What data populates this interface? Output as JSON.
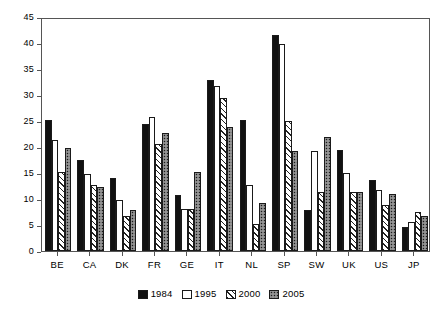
{
  "chart_data": {
    "type": "bar",
    "title": "",
    "subtitle": "",
    "xlabel": "",
    "ylabel": "",
    "ylim": [
      0,
      45
    ],
    "ytick_step": 5,
    "yticks": [
      0,
      5,
      10,
      15,
      20,
      25,
      30,
      35,
      40,
      45
    ],
    "grid": false,
    "legend_position": "bottom-center",
    "categories": [
      "BE",
      "CA",
      "DK",
      "FR",
      "GE",
      "IT",
      "NL",
      "SP",
      "SW",
      "UK",
      "US",
      "JP"
    ],
    "series": [
      {
        "name": "1984",
        "fill": "solid-black",
        "color": "#111111",
        "values": [
          25.2,
          17.5,
          14.0,
          24.5,
          10.7,
          32.8,
          25.1,
          41.5,
          7.9,
          19.5,
          13.7,
          4.7
        ]
      },
      {
        "name": "1995",
        "fill": "white",
        "color": "#ffffff",
        "values": [
          21.4,
          14.8,
          9.9,
          25.7,
          8.1,
          31.7,
          12.7,
          39.9,
          19.2,
          15.0,
          11.7,
          5.6
        ]
      },
      {
        "name": "2000",
        "fill": "diagonal-hatch",
        "color": "#ffffff",
        "values": [
          15.2,
          12.6,
          6.8,
          20.6,
          8.1,
          29.5,
          5.2,
          25.0,
          11.4,
          11.4,
          8.9,
          7.5
        ]
      },
      {
        "name": "2005",
        "fill": "dotted-speckle",
        "color": "#ffffff",
        "values": [
          19.9,
          12.4,
          7.9,
          22.6,
          15.1,
          23.8,
          9.3,
          19.3,
          21.9,
          11.3,
          10.9,
          6.8
        ]
      }
    ]
  },
  "axis": {
    "y_tick_labels": [
      "0",
      "5",
      "10",
      "15",
      "20",
      "25",
      "30",
      "35",
      "40",
      "45"
    ]
  },
  "legend": {
    "items": [
      {
        "label": "1984"
      },
      {
        "label": "1995"
      },
      {
        "label": "2000"
      },
      {
        "label": "2005"
      }
    ]
  }
}
